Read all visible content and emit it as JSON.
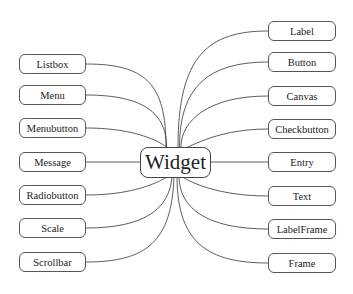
{
  "diagram": {
    "type": "hub-and-spoke",
    "caption_partial": "",
    "center": {
      "label": "Widget"
    },
    "left_nodes": [
      {
        "label": "Listbox",
        "y": 64
      },
      {
        "label": "Menu",
        "y": 95
      },
      {
        "label": "Menubutton",
        "y": 128
      },
      {
        "label": "Message",
        "y": 162
      },
      {
        "label": "Radiobutton",
        "y": 195
      },
      {
        "label": "Scale",
        "y": 228
      },
      {
        "label": "Scrollbar",
        "y": 262
      }
    ],
    "right_nodes": [
      {
        "label": "Label",
        "y": 31
      },
      {
        "label": "Button",
        "y": 62
      },
      {
        "label": "Canvas",
        "y": 96
      },
      {
        "label": "Checkbutton",
        "y": 129
      },
      {
        "label": "Entry",
        "y": 162
      },
      {
        "label": "Text",
        "y": 196
      },
      {
        "label": "LabelFrame",
        "y": 229
      },
      {
        "label": "Frame",
        "y": 263
      }
    ],
    "colors": {
      "line": "#333333",
      "border": "#555555",
      "text": "#222222",
      "background": "#ffffff"
    }
  }
}
